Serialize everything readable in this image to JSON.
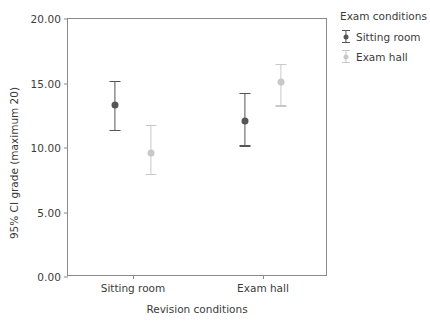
{
  "chart_data": {
    "type": "scatter",
    "title": "",
    "xlabel": "Revision conditions",
    "ylabel": "95% CI grade (maximum 20)",
    "categories": [
      "Sitting room",
      "Exam hall"
    ],
    "ylim": [
      0.0,
      20.0
    ],
    "yticks": [
      "0.00",
      "5.00",
      "10.00",
      "15.00",
      "20.00"
    ],
    "ytick_values": [
      0.0,
      5.0,
      10.0,
      15.0,
      20.0
    ],
    "grid": false,
    "legend_position": "right",
    "legend_title": "Exam conditions",
    "series": [
      {
        "name": "Sitting room",
        "color": "#555555",
        "values": [
          13.3,
          12.1
        ],
        "ci_lower": [
          11.4,
          10.2
        ],
        "ci_upper": [
          15.2,
          14.3
        ]
      },
      {
        "name": "Exam hall",
        "color": "#c8c8c8",
        "values": [
          9.6,
          15.1
        ],
        "ci_lower": [
          8.0,
          13.3
        ],
        "ci_upper": [
          11.8,
          16.5
        ]
      }
    ]
  },
  "axis": {
    "y_title": "95% CI grade (maximum 20)",
    "x_title": "Revision conditions",
    "y_labels": [
      "20.00",
      "15.00",
      "10.00",
      "5.00",
      "0.00"
    ],
    "x_labels": [
      "Sitting room",
      "Exam hall"
    ]
  },
  "legend": {
    "title": "Exam conditions",
    "items": [
      {
        "label": "Sitting room",
        "color": "#555555"
      },
      {
        "label": "Exam hall",
        "color": "#c8c8c8"
      }
    ]
  }
}
